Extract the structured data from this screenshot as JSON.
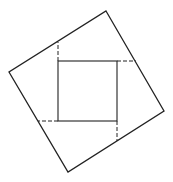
{
  "diagram": {
    "title": "",
    "stroke_color": "#222222",
    "background": "#ffffff",
    "outer_square": {
      "points": [
        [
          106,
          11
        ],
        [
          164,
          111
        ],
        [
          68,
          172
        ],
        [
          9,
          72
        ]
      ]
    },
    "inner_square": {
      "x": 58,
      "y": 61,
      "width": 59,
      "height": 60
    },
    "dashed_segments": [
      {
        "x1": 58,
        "y1": 61,
        "x2": 58,
        "y2": 42
      },
      {
        "x1": 117,
        "y1": 61,
        "x2": 136,
        "y2": 61
      },
      {
        "x1": 117,
        "y1": 121,
        "x2": 117,
        "y2": 141
      },
      {
        "x1": 58,
        "y1": 121,
        "x2": 38,
        "y2": 121
      }
    ]
  }
}
